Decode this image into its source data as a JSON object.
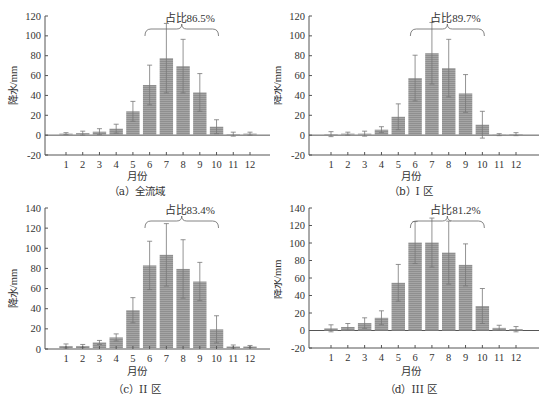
{
  "colors": {
    "bar": "#8f8f8f",
    "bar_stripe": "#a5a5a5",
    "axis": "#555555",
    "error": "#777777",
    "text": "#333333"
  },
  "chart_data": [
    {
      "id": "a",
      "type": "bar",
      "caption": "（a）全流域",
      "xlabel": "月份",
      "ylabel": "降水/mm",
      "categories": [
        "1",
        "2",
        "3",
        "4",
        "5",
        "6",
        "7",
        "8",
        "9",
        "10",
        "11",
        "12"
      ],
      "values": [
        1.5,
        2,
        3.5,
        6.5,
        24,
        50.5,
        77.5,
        69.5,
        43,
        8.5,
        1,
        1.5
      ],
      "errors": [
        1,
        2,
        3,
        4.5,
        10,
        20,
        35,
        27,
        19,
        7,
        2,
        1.5
      ],
      "yticks": [
        -20,
        0,
        20,
        40,
        60,
        80,
        100,
        120
      ],
      "ylim": [
        -20,
        120
      ],
      "annotation": {
        "text": "占比86.5%",
        "from_month": 6,
        "to_month": 10
      },
      "geometry": {
        "left": 45,
        "top": 16,
        "bottom": 155,
        "x1": 66,
        "x12": 250,
        "right": 270,
        "width": 274,
        "height": 170
      }
    },
    {
      "id": "b",
      "type": "bar",
      "caption": "（b）I 区",
      "xlabel": "月份",
      "ylabel": "降水/mm",
      "categories": [
        "1",
        "2",
        "3",
        "4",
        "5",
        "6",
        "7",
        "8",
        "9",
        "10",
        "11",
        "12"
      ],
      "values": [
        1,
        1.5,
        1.5,
        5.5,
        18.5,
        57.5,
        82.5,
        67.5,
        42,
        10.5,
        0.5,
        1
      ],
      "errors": [
        2.5,
        1.5,
        2.5,
        3,
        13,
        23,
        31,
        29,
        19,
        13.5,
        1,
        1.5
      ],
      "yticks": [
        -20,
        0,
        20,
        40,
        60,
        80,
        100,
        120
      ],
      "ylim": [
        -20,
        120
      ],
      "annotation": {
        "text": "占比89.7%",
        "from_month": 6,
        "to_month": 10
      },
      "geometry": {
        "left": 35,
        "top": 16,
        "bottom": 155,
        "x1": 57,
        "x12": 242,
        "right": 265,
        "width": 274,
        "height": 170
      }
    },
    {
      "id": "c",
      "type": "bar",
      "caption": "（c）II 区",
      "xlabel": "月份",
      "ylabel": "降水/mm",
      "categories": [
        "1",
        "2",
        "3",
        "4",
        "5",
        "6",
        "7",
        "8",
        "9",
        "10",
        "11",
        "12"
      ],
      "values": [
        3,
        3,
        6.5,
        11.5,
        38.5,
        83,
        93.5,
        79.5,
        67,
        19.5,
        2.5,
        2.5
      ],
      "errors": [
        2,
        1.5,
        2,
        3.5,
        12.5,
        24,
        31,
        29,
        19,
        13.5,
        1.5,
        1
      ],
      "yticks": [
        0,
        20,
        40,
        60,
        80,
        100,
        120,
        140
      ],
      "ylim": [
        0,
        140
      ],
      "annotation": {
        "text": "占比83.4%",
        "from_month": 6,
        "to_month": 10
      },
      "geometry": {
        "left": 45,
        "top": 8,
        "bottom": 149,
        "x1": 66,
        "x12": 250,
        "right": 270,
        "width": 274,
        "height": 165
      }
    },
    {
      "id": "d",
      "type": "bar",
      "caption": "（d）III 区",
      "xlabel": "月份",
      "ylabel": "降水/mm",
      "categories": [
        "1",
        "2",
        "3",
        "4",
        "5",
        "6",
        "7",
        "8",
        "9",
        "10",
        "11",
        "12"
      ],
      "values": [
        2.5,
        4,
        8.5,
        14.5,
        54.5,
        100.5,
        100.5,
        89,
        75,
        28,
        3,
        1.5
      ],
      "errors": [
        4,
        4,
        6,
        8,
        21,
        24,
        28,
        36,
        24,
        20,
        3,
        3
      ],
      "yticks": [
        -20,
        0,
        20,
        40,
        60,
        80,
        100,
        120,
        140
      ],
      "ylim": [
        -20,
        140
      ],
      "annotation": {
        "text": "占比81.2%",
        "from_month": 6,
        "to_month": 10
      },
      "geometry": {
        "left": 35,
        "top": 8,
        "bottom": 148,
        "x1": 57,
        "x12": 242,
        "right": 265,
        "width": 274,
        "height": 165
      }
    }
  ]
}
